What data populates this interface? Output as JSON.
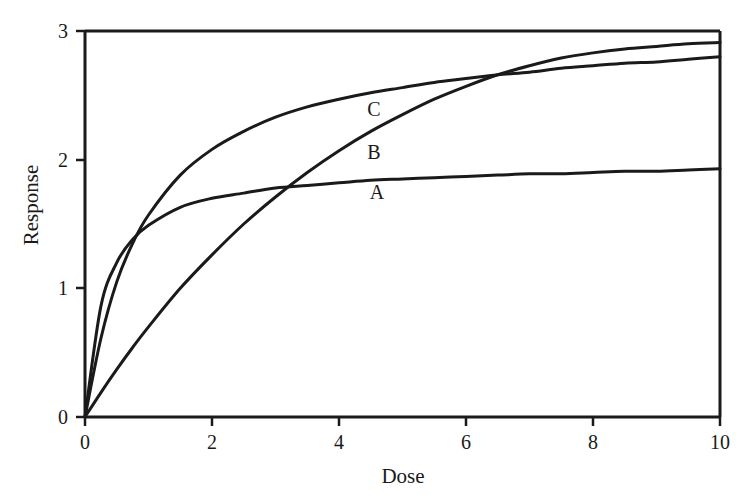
{
  "chart_data": {
    "type": "line",
    "title": "",
    "subtitle": "",
    "xlabel": "Dose",
    "ylabel": "Response",
    "xlim": [
      0,
      10
    ],
    "ylim": [
      0,
      3
    ],
    "xticks": [
      0,
      2,
      4,
      6,
      8,
      10
    ],
    "yticks": [
      0,
      1,
      2,
      3
    ],
    "xtick_labels": [
      "0",
      "2",
      "4",
      "6",
      "8",
      "10"
    ],
    "ytick_labels": [
      "0",
      "1",
      "2",
      "3"
    ],
    "grid": false,
    "legend": "inline-curve-labels",
    "legend_position": "inline",
    "line_color": "#1a1a1a",
    "background_color": "#ffffff",
    "axis_color": "#1a1a1a",
    "annotations": [
      {
        "text": "C",
        "x": 4.55,
        "y": 2.36
      },
      {
        "text": "B",
        "x": 4.55,
        "y": 2.03
      },
      {
        "text": "A",
        "x": 4.6,
        "y": 1.72
      }
    ],
    "x": [
      0,
      0.25,
      0.5,
      0.75,
      1,
      1.5,
      2,
      2.5,
      3,
      3.5,
      4,
      4.5,
      5,
      5.5,
      6,
      6.5,
      7,
      7.5,
      8,
      8.5,
      9,
      9.5,
      10
    ],
    "series": [
      {
        "name": "A",
        "label": "A",
        "values": [
          0,
          0.86,
          1.2,
          1.38,
          1.49,
          1.63,
          1.7,
          1.74,
          1.78,
          1.8,
          1.82,
          1.84,
          1.85,
          1.86,
          1.87,
          1.88,
          1.89,
          1.89,
          1.9,
          1.91,
          1.91,
          1.92,
          1.93
        ],
        "description": "steep early saturation, plateau near 1.93"
      },
      {
        "name": "B",
        "label": "B",
        "values": [
          0,
          0.19,
          0.37,
          0.54,
          0.7,
          1.0,
          1.26,
          1.5,
          1.71,
          1.9,
          2.07,
          2.22,
          2.35,
          2.47,
          2.57,
          2.66,
          2.73,
          2.79,
          2.83,
          2.86,
          2.88,
          2.9,
          2.91
        ],
        "description": "slowest rise, highest final value 2.91 at dose 10"
      },
      {
        "name": "C",
        "label": "C",
        "values": [
          0,
          0.61,
          1.05,
          1.35,
          1.57,
          1.88,
          2.08,
          2.22,
          2.33,
          2.41,
          2.47,
          2.52,
          2.56,
          2.6,
          2.63,
          2.66,
          2.68,
          2.71,
          2.73,
          2.75,
          2.76,
          2.78,
          2.8
        ],
        "description": "steepest initial rise, plateau near 2.80"
      }
    ],
    "crossings": [
      {
        "series": [
          "A",
          "B"
        ],
        "x": 3.0,
        "y": 1.78
      },
      {
        "series": [
          "B",
          "C"
        ],
        "x": 7.9,
        "y": 2.72
      }
    ]
  }
}
